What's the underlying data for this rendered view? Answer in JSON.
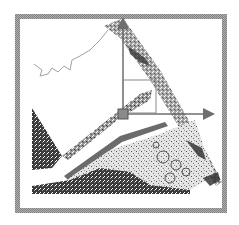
{
  "figure": {
    "frame": {
      "x": 15,
      "y": 14,
      "width": 212,
      "height": 199,
      "border_color": "#9a9a9a",
      "border_width": 5
    },
    "axes": {
      "origin": {
        "x": 123,
        "y": 113
      },
      "vertical_axis_top": {
        "x": 123,
        "y": 14
      },
      "horizontal_axis_end": {
        "x": 219,
        "y": 114
      },
      "color": "#6e6e6e",
      "origin_marker_color": "#8a8a8a",
      "inner_box": {
        "x": 123,
        "y": 80,
        "width": 33,
        "height": 33
      }
    },
    "colors": {
      "dark_tissue": "#2a2a2a",
      "mid_tissue": "#6a6a6a",
      "light_tissue": "#b8b8b8",
      "background": "#ffffff"
    }
  }
}
